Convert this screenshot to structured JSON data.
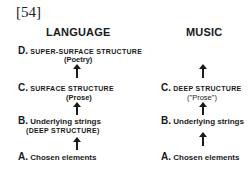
{
  "figure_number": "[54]",
  "columns": {
    "language": {
      "heading": "LANGUAGE",
      "levels": [
        {
          "letter": "D.",
          "label": "SUPER-SURFACE STRUCTURE",
          "note": "(Poetry)"
        },
        {
          "letter": "C.",
          "label": "SURFACE STRUCTURE",
          "note": "(Prose)"
        },
        {
          "letter": "B.",
          "label": "Underlying strings",
          "note": "(DEEP STRUCTURE)"
        },
        {
          "letter": "A.",
          "label": "Chosen elements",
          "note": ""
        }
      ]
    },
    "music": {
      "heading": "MUSIC",
      "levels": [
        {
          "letter": "C.",
          "label": "DEEP STRUCTURE",
          "note": "(\"Prose\")"
        },
        {
          "letter": "B.",
          "label": "Underlying strings",
          "note": ""
        },
        {
          "letter": "A.",
          "label": "Chosen elements",
          "note": ""
        }
      ]
    }
  },
  "arrow_icon": "up-arrow-icon"
}
